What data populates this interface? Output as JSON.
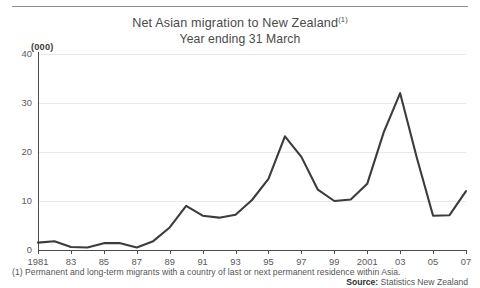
{
  "header": {
    "cut_off_text_above": ""
  },
  "title": {
    "main": "Net Asian migration to New Zealand",
    "footnote_marker": "(1)",
    "subtitle": "Year ending 31 March"
  },
  "axis": {
    "unit_label": "(000)",
    "y_ticks": [
      "0",
      "10",
      "20",
      "30",
      "40"
    ],
    "x_ticks": [
      "1981",
      "83",
      "85",
      "87",
      "89",
      "91",
      "93",
      "95",
      "97",
      "99",
      "2001",
      "03",
      "05",
      "07"
    ]
  },
  "footnote": {
    "text": "(1) Permanent and long-term migrants with a country of last or next permanent residence within Asia.",
    "source_label": "Source:",
    "source_value": "Statistics New Zealand"
  },
  "colors": {
    "line": "#3c3c3c",
    "axis": "#4d4d4d",
    "grid": "#e9e9e9",
    "text": "#4a4a4a"
  },
  "chart_data": {
    "type": "line",
    "title": "Net Asian migration to New Zealand(1)",
    "subtitle": "Year ending 31 March",
    "xlabel": "",
    "ylabel": "(000)",
    "ylim": [
      0,
      40
    ],
    "yticks": [
      0,
      10,
      20,
      30,
      40
    ],
    "xlim": [
      1981,
      2007
    ],
    "xticks": [
      1981,
      1983,
      1985,
      1987,
      1989,
      1991,
      1993,
      1995,
      1997,
      1999,
      2001,
      2003,
      2005,
      2007
    ],
    "grid": true,
    "legend": "none",
    "units": "thousands",
    "x": [
      1981,
      1982,
      1983,
      1984,
      1985,
      1986,
      1987,
      1988,
      1989,
      1990,
      1991,
      1992,
      1993,
      1994,
      1995,
      1996,
      1997,
      1998,
      1999,
      2000,
      2001,
      2002,
      2003,
      2004,
      2005,
      2006,
      2007
    ],
    "values": [
      1.5,
      1.8,
      0.6,
      0.5,
      1.4,
      1.4,
      0.5,
      1.8,
      4.6,
      9.0,
      7.0,
      6.6,
      7.2,
      10.2,
      14.5,
      23.2,
      19.0,
      12.3,
      10.0,
      10.3,
      13.5,
      24.0,
      32.0,
      19.0,
      7.0,
      7.1,
      12.0
    ],
    "series": [
      {
        "name": "Net Asian migration",
        "values": [
          1.5,
          1.8,
          0.6,
          0.5,
          1.4,
          1.4,
          0.5,
          1.8,
          4.6,
          9.0,
          7.0,
          6.6,
          7.2,
          10.2,
          14.5,
          23.2,
          19.0,
          12.3,
          10.0,
          10.3,
          13.5,
          24.0,
          32.0,
          19.0,
          7.0,
          7.1,
          12.0
        ]
      }
    ]
  }
}
